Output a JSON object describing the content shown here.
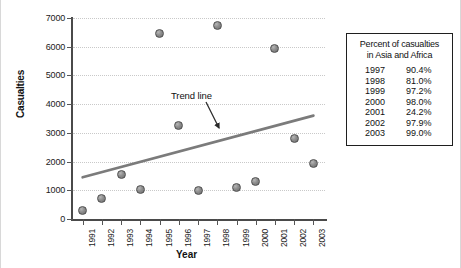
{
  "chart_data": {
    "type": "scatter",
    "title": "",
    "xlabel": "Year",
    "ylabel": "Casualties",
    "x": [
      1991,
      1992,
      1993,
      1994,
      1995,
      1996,
      1997,
      1998,
      1999,
      2000,
      2001,
      2002,
      2003
    ],
    "categories": [
      "1991",
      "1992",
      "1993",
      "1994",
      "1995",
      "1996",
      "1997",
      "1998",
      "1999",
      "2000",
      "2001",
      "2002",
      "2003"
    ],
    "values": [
      300,
      700,
      1550,
      1030,
      6450,
      3250,
      1000,
      6750,
      1100,
      1300,
      5950,
      2820,
      1950
    ],
    "series": [
      {
        "name": "Casualties",
        "values": [
          300,
          700,
          1550,
          1030,
          6450,
          3250,
          1000,
          6750,
          1100,
          1300,
          5950,
          2820,
          1950
        ]
      },
      {
        "name": "Trend line",
        "type": "line",
        "x": [
          1991,
          2003
        ],
        "values": [
          1450,
          3600
        ]
      }
    ],
    "xlim": [
      1990.5,
      2003.6
    ],
    "ylim": [
      0,
      7000
    ],
    "yticks": [
      0,
      1000,
      2000,
      3000,
      4000,
      5000,
      6000,
      7000
    ],
    "ytick_labels": [
      "0",
      "1000",
      "2000",
      "3000",
      "4000",
      "5000",
      "6000",
      "7000"
    ],
    "grid": true,
    "legend": "none",
    "annotations": [
      {
        "text": "Trend line",
        "points_to_series": "Trend line"
      }
    ]
  },
  "annotation": {
    "trend_line_label": "Trend line"
  },
  "side_table": {
    "title_line1": "Percent of casualties",
    "title_line2": "in Asia and Africa",
    "columns": [
      "Year",
      "Percent"
    ],
    "rows": [
      {
        "year": "1997",
        "percent": "90.4%"
      },
      {
        "year": "1998",
        "percent": "81.0%"
      },
      {
        "year": "1999",
        "percent": "97.2%"
      },
      {
        "year": "2000",
        "percent": "98.0%"
      },
      {
        "year": "2001",
        "percent": "24.2%"
      },
      {
        "year": "2002",
        "percent": "97.9%"
      },
      {
        "year": "2003",
        "percent": "99.0%"
      }
    ]
  },
  "colors": {
    "point_fill": "#8f8f8f",
    "point_stroke": "#4f4f4f",
    "trend_line": "#7b7b7b",
    "axis": "#4a4a4a",
    "grid": "#c9c9c9",
    "text": "#111111",
    "background": "#ffffff"
  }
}
